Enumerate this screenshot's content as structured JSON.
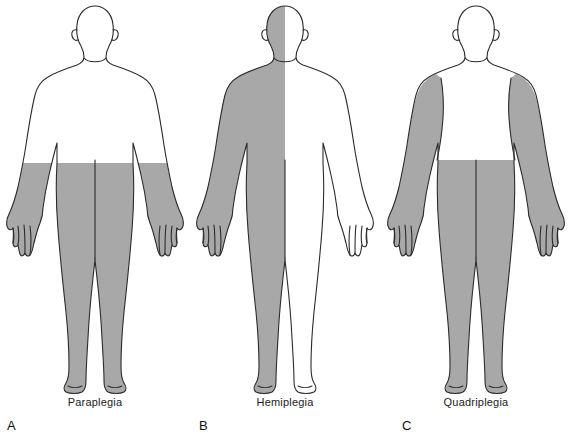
{
  "figure": {
    "kind": "medical-illustration",
    "background_color": "#ffffff",
    "affected_fill_color": "#a8a8a8",
    "unaffected_fill_color": "#ffffff",
    "outline_color": "#2b2b2b",
    "panels": [
      {
        "letter": "A",
        "label": "Paraplegia",
        "affected_regions": "lower body from waist down, both legs and both feet",
        "unaffected_regions": "head, neck, trunk above waist, both arms and hands"
      },
      {
        "letter": "B",
        "label": "Hemiplegia",
        "affected_regions": "entire left vertical half of the body including head, arm, leg and foot",
        "unaffected_regions": "entire right vertical half of the body"
      },
      {
        "letter": "C",
        "label": "Quadriplegia",
        "affected_regions": "both arms and shoulders, and lower body from waist down including both legs and feet",
        "unaffected_regions": "head, neck and central trunk"
      }
    ],
    "caption_partial": ""
  }
}
